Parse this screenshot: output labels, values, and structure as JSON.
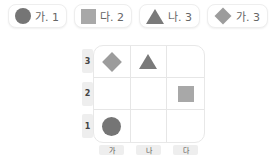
{
  "legend": [
    {
      "shape": "circle",
      "icon": "circle-icon",
      "label": "가. 1",
      "color": "#757575"
    },
    {
      "shape": "square",
      "icon": "square-icon",
      "label": "다. 2",
      "color": "#a8a8a8"
    },
    {
      "shape": "triangle",
      "icon": "triangle-icon",
      "label": "나. 3",
      "color": "#7a7a7a"
    },
    {
      "shape": "diamond",
      "icon": "diamond-icon",
      "label": "가. 3",
      "color": "#9c9c9c"
    }
  ],
  "grid": {
    "rows": [
      "3",
      "2",
      "1"
    ],
    "columns": [
      "가",
      "나",
      "다"
    ],
    "cells": [
      [
        "diamond",
        "triangle",
        ""
      ],
      [
        "",
        "",
        "square"
      ],
      [
        "circle",
        "",
        ""
      ]
    ]
  }
}
